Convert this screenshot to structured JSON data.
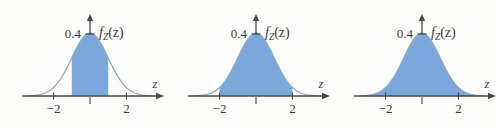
{
  "figure": {
    "background_color": "#fdfdfc",
    "curve_color": "#8fa8c8",
    "fill_color": "#7ba7dd",
    "axis_color": "#4a4a4a",
    "text_color": "#3a3a3a"
  },
  "panels": [
    {
      "id": "panel-1",
      "y_axis_label_value": "0.4",
      "density_symbol": "f",
      "density_subscript": "Z",
      "density_argument": "(z)",
      "x_axis_label": "z",
      "x_tick_labels": [
        "−2",
        "2"
      ],
      "x_tick_values": [
        -2,
        2
      ],
      "shaded_from": -1,
      "shaded_to": 1,
      "shaded_description": "area between z = −1 and z = 1"
    },
    {
      "id": "panel-2",
      "y_axis_label_value": "0.4",
      "density_symbol": "f",
      "density_subscript": "Z",
      "density_argument": "(z)",
      "x_axis_label": "z",
      "x_tick_labels": [
        "−2",
        "2"
      ],
      "x_tick_values": [
        -2,
        2
      ],
      "shaded_from": -2,
      "shaded_to": 2,
      "shaded_description": "area between z = −2 and z = 2"
    },
    {
      "id": "panel-3",
      "y_axis_label_value": "0.4",
      "density_symbol": "f",
      "density_subscript": "Z",
      "density_argument": "(z)",
      "x_axis_label": "z",
      "x_tick_labels": [
        "−2",
        "2"
      ],
      "x_tick_values": [
        -2,
        2
      ],
      "shaded_from": -3.4,
      "shaded_to": 3.4,
      "shaded_description": "entire area under the curve"
    }
  ],
  "chart_data": {
    "type": "area",
    "xlabel": "z",
    "ylabel": "f_Z(z)",
    "xlim": [
      -3.4,
      3.4
    ],
    "ylim": [
      0,
      0.42
    ],
    "xticks": [
      -2,
      0,
      2
    ],
    "xticklabels": [
      "−2",
      "",
      "2"
    ],
    "yticks": [
      0.4
    ],
    "yticklabels": [
      "0.4"
    ],
    "grid": false,
    "legend": "none",
    "series": [
      {
        "name": "standard normal pdf",
        "x": [
          -3.4,
          -3.2,
          -3.0,
          -2.8,
          -2.6,
          -2.4,
          -2.2,
          -2.0,
          -1.8,
          -1.6,
          -1.4,
          -1.2,
          -1.0,
          -0.8,
          -0.6,
          -0.4,
          -0.2,
          0.0,
          0.2,
          0.4,
          0.6,
          0.8,
          1.0,
          1.2,
          1.4,
          1.6,
          1.8,
          2.0,
          2.2,
          2.4,
          2.6,
          2.8,
          3.0,
          3.2,
          3.4
        ],
        "y": [
          0.0012,
          0.0024,
          0.0044,
          0.0079,
          0.0136,
          0.0224,
          0.0355,
          0.054,
          0.079,
          0.1109,
          0.1497,
          0.1942,
          0.242,
          0.2897,
          0.3332,
          0.3683,
          0.391,
          0.3989,
          0.391,
          0.3683,
          0.3332,
          0.2897,
          0.242,
          0.1942,
          0.1497,
          0.1109,
          0.079,
          0.054,
          0.0355,
          0.0224,
          0.0136,
          0.0079,
          0.0044,
          0.0024,
          0.0012
        ]
      }
    ],
    "shaded_regions": [
      {
        "panel": 1,
        "from": -1,
        "to": 1,
        "approx_probability": 0.68
      },
      {
        "panel": 2,
        "from": -2,
        "to": 2,
        "approx_probability": 0.95
      },
      {
        "panel": 3,
        "from": -3.4,
        "to": 3.4,
        "approx_probability": 1.0
      }
    ]
  }
}
